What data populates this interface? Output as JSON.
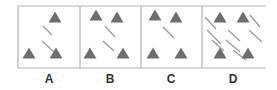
{
  "figure": {
    "panels": [
      {
        "label": "A",
        "x": 18,
        "triangles": [
          [
            55,
            17
          ],
          [
            29,
            53
          ],
          [
            56,
            53
          ]
        ],
        "lines": [
          [
            43,
            26,
            52,
            35
          ],
          [
            42,
            41,
            54,
            52
          ]
        ]
      },
      {
        "label": "B",
        "x": 80,
        "triangles": [
          [
            96,
            15
          ],
          [
            117,
            17
          ],
          [
            90,
            53
          ],
          [
            123,
            53
          ]
        ],
        "lines": [
          [
            105,
            26,
            115,
            37
          ],
          [
            103,
            41,
            114,
            51
          ]
        ]
      },
      {
        "label": "C",
        "x": 141,
        "triangles": [
          [
            155,
            15
          ],
          [
            176,
            17
          ],
          [
            153,
            53
          ],
          [
            181,
            53
          ]
        ],
        "lines": [
          [
            163,
            27,
            174,
            38
          ]
        ]
      },
      {
        "label": "D",
        "x": 202,
        "triangles": [
          [
            220,
            17
          ],
          [
            243,
            17
          ],
          [
            220,
            53
          ],
          [
            248,
            53
          ]
        ],
        "lines": [
          [
            205,
            17,
            216,
            29
          ],
          [
            250,
            15,
            260,
            27
          ],
          [
            207,
            30,
            221,
            44
          ],
          [
            228,
            30,
            240,
            41
          ],
          [
            249,
            30,
            262,
            42
          ],
          [
            212,
            40,
            224,
            51
          ],
          [
            226,
            40,
            240,
            52
          ],
          [
            233,
            50,
            246,
            60
          ]
        ]
      }
    ],
    "colors": {
      "border": "#b5b5b5",
      "triangle": "#6e6e6e",
      "line": "#9a9a9a",
      "label": "#333333"
    }
  }
}
